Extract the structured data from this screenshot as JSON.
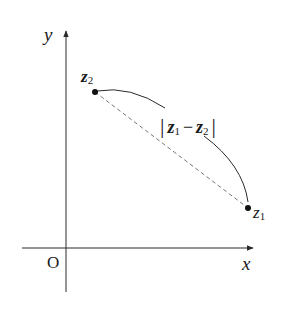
{
  "diagram": {
    "type": "complex-plane-distance",
    "axes": {
      "x_label": "x",
      "y_label": "y",
      "origin_label": "O"
    },
    "points": [
      {
        "id": "z2",
        "label": "z",
        "subscript": "2"
      },
      {
        "id": "z1",
        "label": "z",
        "subscript": "1"
      }
    ],
    "distance_label": {
      "open_bar": "|",
      "z1": "z",
      "z1_sub": "1",
      "minus": "−",
      "z2": "z",
      "z2_sub": "2",
      "close_bar": "|"
    },
    "colors": {
      "stroke": "#2a2a2a",
      "dashed": "#777777",
      "text": "#1a1a1a"
    }
  }
}
